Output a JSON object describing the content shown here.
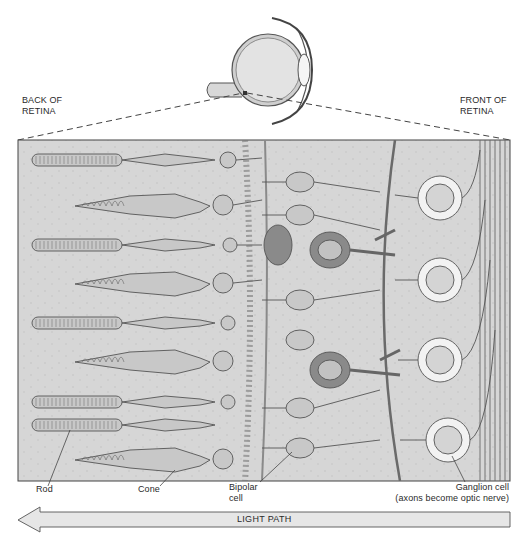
{
  "diagram": {
    "header_labels": {
      "back": [
        "BACK OF",
        "RETINA"
      ],
      "front": [
        "FRONT OF",
        "RETINA"
      ]
    },
    "cell_labels": {
      "rod": "Rod",
      "cone": "Cone",
      "bipolar": [
        "Bipolar",
        "cell"
      ],
      "ganglion": [
        "Ganglion cell",
        "(axons become optic nerve)"
      ]
    },
    "arrow": {
      "label": "LIGHT PATH",
      "direction": "left"
    },
    "colors": {
      "background": "#ffffff",
      "tissue": "#d4d4d4",
      "cell_fill": "#c6c6c6",
      "cell_outline": "#555555",
      "dark_cell": "#8a8a8a",
      "ganglion_fill": "#f2f2f2",
      "arrow_fill": "#e6e6e6",
      "dash_line": "#444444"
    },
    "photoreceptor_rows": [
      {
        "type": "rod",
        "y": 160
      },
      {
        "type": "cone",
        "y": 205
      },
      {
        "type": "rod",
        "y": 245
      },
      {
        "type": "cone",
        "y": 283
      },
      {
        "type": "rod",
        "y": 323
      },
      {
        "type": "cone",
        "y": 362
      },
      {
        "type": "rod",
        "y": 402
      },
      {
        "type": "rod",
        "y": 425
      },
      {
        "type": "cone",
        "y": 460
      }
    ],
    "ganglion_cells": [
      {
        "cx": 440,
        "cy": 198
      },
      {
        "cx": 440,
        "cy": 280
      },
      {
        "cx": 440,
        "cy": 360
      },
      {
        "cx": 448,
        "cy": 440
      }
    ]
  }
}
